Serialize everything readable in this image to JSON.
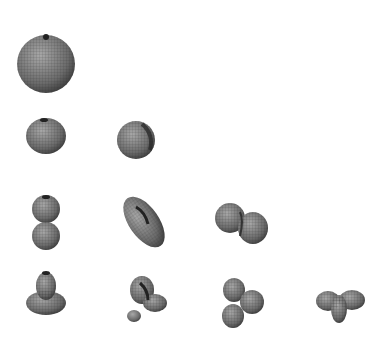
{
  "figure": {
    "background": "#ffffff",
    "mesh_color": "#555555",
    "rows": [
      {
        "l": 0,
        "shapes": [
          {
            "m": 0,
            "kind": "sphere",
            "cx": 46,
            "cy": 64
          }
        ]
      },
      {
        "l": 1,
        "shapes": [
          {
            "m": 0,
            "kind": "sphere-small",
            "cx": 46,
            "cy": 135
          },
          {
            "m": 1,
            "kind": "sphere-small-tilted",
            "cx": 135,
            "cy": 140
          }
        ]
      },
      {
        "l": 2,
        "shapes": [
          {
            "m": 0,
            "kind": "dumbbell-vertical",
            "cx": 46,
            "cy": 222
          },
          {
            "m": 1,
            "kind": "dumbbell-diagonal",
            "cx": 143,
            "cy": 222
          },
          {
            "m": 2,
            "kind": "dumbbell-tilted",
            "cx": 240,
            "cy": 222
          }
        ]
      },
      {
        "l": 3,
        "shapes": [
          {
            "m": 0,
            "kind": "lobe-with-torus",
            "cx": 46,
            "cy": 296
          },
          {
            "m": 1,
            "kind": "twisted-lobes",
            "cx": 145,
            "cy": 296
          },
          {
            "m": 2,
            "kind": "clover",
            "cx": 243,
            "cy": 298
          },
          {
            "m": 3,
            "kind": "multi-lobe",
            "cx": 340,
            "cy": 302
          }
        ]
      }
    ]
  }
}
